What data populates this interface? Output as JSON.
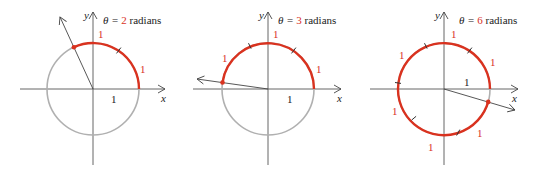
{
  "figure": {
    "panels": [
      {
        "title_prefix": "θ = ",
        "theta_value": "2",
        "title_suffix": " radians",
        "x_axis_label": "x",
        "y_axis_label": "y",
        "unit_radius_label": "1",
        "arc_segment_labels": [
          "1",
          "1"
        ]
      },
      {
        "title_prefix": "θ = ",
        "theta_value": "3",
        "title_suffix": " radians",
        "x_axis_label": "x",
        "y_axis_label": "y",
        "unit_radius_label": "1",
        "arc_segment_labels": [
          "1",
          "1",
          "1"
        ]
      },
      {
        "title_prefix": "θ = ",
        "theta_value": "6",
        "title_suffix": " radians",
        "x_axis_label": "x",
        "y_axis_label": "y",
        "unit_radius_label": "1",
        "arc_segment_labels": [
          "1",
          "1",
          "1",
          "1",
          "1",
          "1"
        ]
      }
    ],
    "colors": {
      "arc": "#d9321f",
      "circle": "#b0b0b0",
      "axis": "#555555",
      "text": "#222222"
    }
  }
}
